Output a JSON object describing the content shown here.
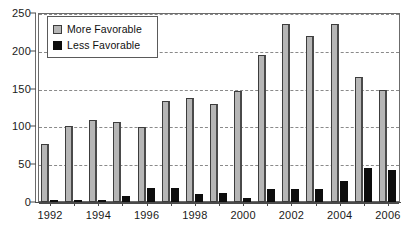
{
  "chart_data": {
    "type": "bar",
    "title": "",
    "subtitle": "",
    "xlabel": "",
    "ylabel": "",
    "ylim": [
      0,
      250
    ],
    "yticks": [
      0,
      50,
      100,
      150,
      200,
      250
    ],
    "ytick_labels": [
      "0",
      "50",
      "100",
      "150",
      "200",
      "250"
    ],
    "grid": true,
    "grid_axis": "y",
    "legend_position": "upper-left",
    "categories": [
      "1992",
      "1993",
      "1994",
      "1995",
      "1996",
      "1997",
      "1998",
      "1999",
      "2000",
      "2001",
      "2002",
      "2003",
      "2004",
      "2005",
      "2006"
    ],
    "xtick_labels_shown": [
      "1992",
      "1994",
      "1996",
      "1998",
      "2000",
      "2002",
      "2004",
      "2006"
    ],
    "series": [
      {
        "name": "More Favorable",
        "color": "#b6b6b6",
        "values": [
          77,
          100,
          108,
          106,
          99,
          134,
          137,
          130,
          147,
          195,
          236,
          220,
          236,
          166,
          148
        ]
      },
      {
        "name": "Less Favorable",
        "color": "#0d0d0d",
        "values": [
          0,
          2,
          3,
          8,
          19,
          19,
          11,
          12,
          5,
          17,
          17,
          17,
          28,
          45,
          42
        ]
      }
    ]
  },
  "legend": {
    "entries": [
      {
        "label": "More Favorable",
        "swatch": "more"
      },
      {
        "label": "Less Favorable",
        "swatch": "less"
      }
    ]
  },
  "colors": {
    "more_favorable": "#b6b6b6",
    "less_favorable": "#0d0d0d",
    "axis": "#4a4a4a",
    "grid": "#8a8a8a",
    "background": "#ffffff"
  }
}
